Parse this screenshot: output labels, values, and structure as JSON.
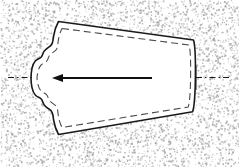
{
  "figure": {
    "caption": "",
    "width": 239,
    "height": 167,
    "background_style": "stipple-texture",
    "colors": {
      "background": "#ffffff",
      "stipple_dot": "#9a9a9a",
      "part_fill": "#ffffff",
      "outline": "#1a1a1a",
      "seam_dash": "#4a4a4a",
      "centerline": "#1a1a1a",
      "arrow": "#101010"
    }
  },
  "part_outline": {
    "name": "part-outline",
    "description": "Closed white shield / bullet shaped profile: straight sloping top edge, near-vertical slightly convex right edge, straight sloping bottom edge, and a wavy scalloped pointed left edge with two small notches",
    "stroke_width": 1.6,
    "path": "M 58.5 21.5 L 193.5 40.0 C 195.2 45.0 195.6 60.0 195.4 76.5 C 195.2 94.0 194.4 106.5 192.6 111.8 L 58.5 134.5 C 56.0 130.0 54.4 125.0 53.6 120.0 C 52.9 115.6 53.2 112.4 50.5 110.2 C 47.8 108.0 45.6 107.0 44.0 104.6 C 42.6 102.5 42.7 100.4 41.3 99.0 C 39.7 97.4 37.2 97.0 35.5 95.2 C 33.6 93.2 32.6 90.6 32.0 87.6 C 31.2 83.6 31.0 80.4 31.0 78.0 C 31.0 75.5 31.2 72.3 32.0 68.4 C 32.6 65.4 33.6 62.8 35.5 60.8 C 37.2 59.0 39.7 58.6 41.3 57.0 C 42.7 55.6 42.6 53.5 44.0 51.4 C 45.6 49.0 47.8 48.0 50.5 45.8 C 53.2 43.6 52.9 40.4 53.6 36.0 C 54.4 31.0 56.0 26.0 58.5 21.5 Z"
  },
  "seam_line": {
    "name": "inner-seam-dashed-line",
    "description": "Dashed stitch/seam line offset approximately 5 px inside the part outline",
    "stroke_width": 1.1,
    "dash_pattern": "7 4",
    "path": "M 62.0 28.5 L 189.0 45.0 C 190.4 49.6 190.8 61.0 190.6 76.5 C 190.4 92.0 189.7 102.5 188.2 107.0 L 62.0 127.5 C 60.0 123.6 58.8 119.2 58.2 114.8 C 57.6 110.8 57.9 107.6 55.3 105.4 C 52.8 103.3 50.7 102.3 49.2 100.0 C 47.9 98.0 48.0 96.0 46.5 94.6 C 45.0 93.2 42.7 92.8 41.1 91.0 C 39.4 89.2 38.5 86.8 37.9 84.0 C 37.2 80.4 37.0 79.2 37.0 78.0 C 37.0 76.8 37.2 75.6 37.9 72.0 C 38.5 69.2 39.4 66.8 41.1 65.0 C 42.7 63.2 45.0 62.8 46.5 61.4 C 48.0 60.0 47.9 58.0 49.2 56.0 C 50.7 53.7 52.8 52.7 55.3 50.6 C 57.9 48.4 57.6 45.2 58.2 41.2 C 58.8 36.8 60.0 32.4 62.0 28.5 Z"
  },
  "centerline": {
    "name": "horizontal-centerline",
    "description": "Dash-dot construction centerline at the vertical mid-height, drawn only outside the part on the left and right",
    "y": 77.5,
    "stroke_width": 1.1,
    "dash_pattern": "6 3 1.5 3",
    "segments": [
      {
        "x1": 8.0,
        "x2": 33.0
      },
      {
        "x1": 196.0,
        "x2": 231.0
      }
    ]
  },
  "direction_arrow": {
    "name": "direction-arrow",
    "description": "Solid black arrow pointing left along the centerline inside the part",
    "direction": "left",
    "y": 78.0,
    "tail_x": 152.0,
    "tip_x": 52.0,
    "shaft_width": 1.9,
    "head_length": 11.0,
    "head_half_width": 4.0
  },
  "right_edge_mark": {
    "name": "right-edge-tick",
    "description": "Short vertical tick at the right edge where the centerline meets the profile",
    "x": 196.0,
    "y1": 66.0,
    "y2": 90.0,
    "stroke_width": 1.0
  },
  "stipple": {
    "name": "background-stipple",
    "description": "Random halftone dot texture filling the field around the part",
    "dot_count": 5200,
    "dot_radius_min": 0.35,
    "dot_radius_max": 0.95,
    "seed": 20240517
  }
}
